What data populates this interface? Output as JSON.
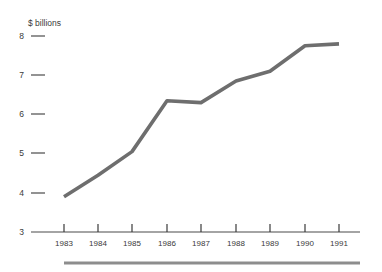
{
  "chart_data": {
    "type": "line",
    "title": "",
    "subtitle": "",
    "xlabel": "",
    "ylabel": "$ billions",
    "unit_label": "$ billions",
    "categories": [
      "1983",
      "1984",
      "1985",
      "1986",
      "1987",
      "1988",
      "1989",
      "1990",
      "1991"
    ],
    "x": [
      1983,
      1984,
      1985,
      1986,
      1987,
      1988,
      1989,
      1990,
      1991
    ],
    "values": [
      3.9,
      4.45,
      5.05,
      6.35,
      6.3,
      6.85,
      7.1,
      7.75,
      7.8
    ],
    "series": [
      {
        "name": "",
        "values": [
          3.9,
          4.45,
          5.05,
          6.35,
          6.3,
          6.85,
          7.1,
          7.75,
          7.8
        ]
      }
    ],
    "ylim": [
      3,
      8
    ],
    "xlim": [
      "1983",
      "1991"
    ],
    "ytick_labels": [
      "8",
      "7",
      "6",
      "5",
      "4",
      "3"
    ],
    "ytick_values": [
      8,
      7,
      6,
      5,
      4,
      3
    ],
    "xtick_labels": [
      "1983",
      "1984",
      "1985",
      "1986",
      "1987",
      "1988",
      "1989",
      "1990",
      "1991"
    ],
    "grid": false,
    "legend": false,
    "legend_position": "none",
    "annotations": [],
    "colors": {
      "series_line": "#6e6e6e",
      "axis": "#4a4a4a",
      "text": "#3a3a3a",
      "footer_rule": "#8d8d8d",
      "background": "#ffffff"
    }
  }
}
